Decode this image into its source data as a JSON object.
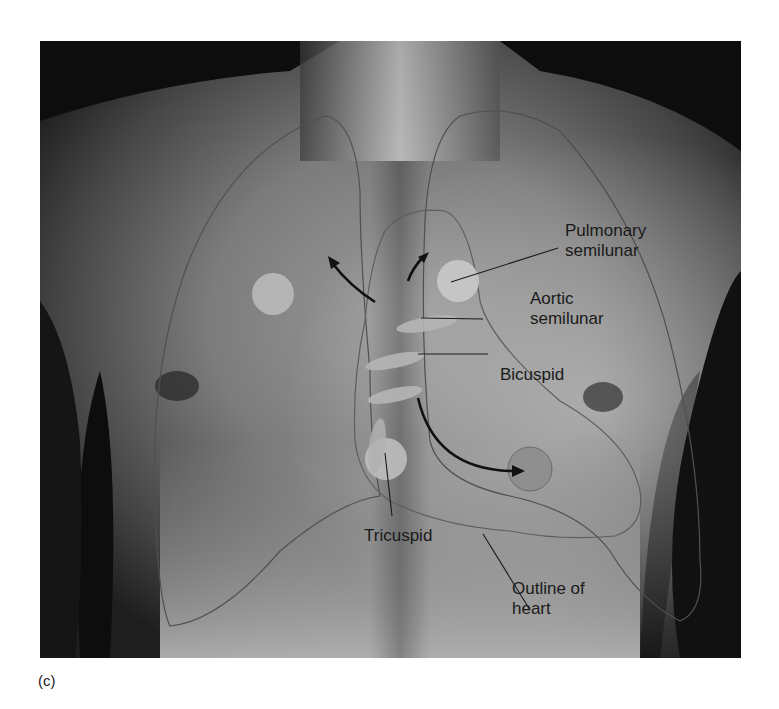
{
  "figure": {
    "panel_label": "(c)",
    "labels": {
      "pulmonary": "Pulmonary\nsemilunar",
      "aortic": "Aortic\nsemilunar",
      "bicuspid": "Bicuspid",
      "tricuspid": "Tricuspid",
      "outline": "Outline of\nheart"
    },
    "colors": {
      "skin_dark": "#1c1c1c",
      "skin_mid": "#7a7a7a",
      "skin_light": "#c9c9c9",
      "valve_fill": "#b5b5b5",
      "auscultation_fill": "#bdbdbd",
      "bicuspid_site_fill": "#8f8f8f",
      "outline_stroke": "#5e5e5e",
      "arrow": "#111111",
      "text": "#1a1a1a"
    }
  }
}
